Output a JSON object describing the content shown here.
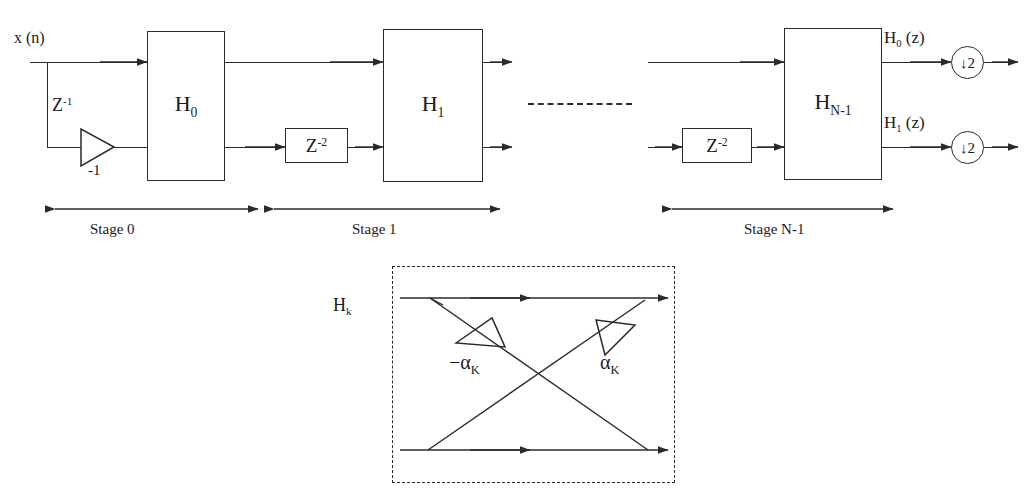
{
  "diagram": {
    "input_label": "x (n)",
    "delay_z1": "Z",
    "delay_z1_exp": "-1",
    "gain_minus_one": "-1",
    "delay_z2": "Z",
    "delay_z2_exp": "-2",
    "ellipsis": "- - - - - - - - -",
    "line_color": "#2a2a2a",
    "background": "#ffffff"
  },
  "blocks": [
    {
      "name": "H0",
      "base": "H",
      "sub": "0"
    },
    {
      "name": "H1",
      "base": "H",
      "sub": "1"
    },
    {
      "name": "HN1",
      "base": "H",
      "sub": "N-1"
    }
  ],
  "delays": [
    {
      "name": "delay-stage1",
      "base": "Z",
      "exp": "-2"
    },
    {
      "name": "delay-stageN",
      "base": "Z",
      "exp": "-2"
    }
  ],
  "outputs": [
    {
      "name": "H0z",
      "base": "H",
      "sub": "0",
      "arg": "(z)",
      "downsampler": "2",
      "arrow": "↓"
    },
    {
      "name": "H1z",
      "base": "H",
      "sub": "1",
      "arg": "(z)",
      "downsampler": "2",
      "arrow": "↓"
    }
  ],
  "stages": [
    {
      "label": "Stage  0"
    },
    {
      "label": "Stage  1"
    },
    {
      "label": "Stage N-1"
    }
  ],
  "detail": {
    "block_base": "H",
    "block_sub": "k",
    "coef_neg_base": "−α",
    "coef_neg_sub": "K",
    "coef_pos_base": "α",
    "coef_pos_sub": "K"
  }
}
